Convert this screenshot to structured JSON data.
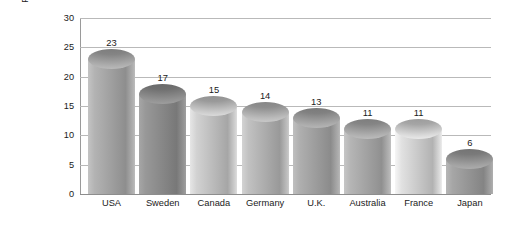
{
  "chart_data": {
    "type": "bar",
    "title": "",
    "subtitle": "",
    "xlabel": "",
    "ylabel": "Percentage of single-parent families\nwith children under 18",
    "categories": [
      "USA",
      "Sweden",
      "Canada",
      "Germany",
      "U.K.",
      "Australia",
      "France",
      "Japan"
    ],
    "values": [
      23,
      17,
      15,
      14,
      13,
      11,
      11,
      6
    ],
    "value_labels": [
      "23",
      "17",
      "15",
      "14",
      "13",
      "11",
      "11",
      "6"
    ],
    "ylim": [
      0,
      30
    ],
    "yticks": [
      0,
      5,
      10,
      15,
      20,
      25,
      30
    ],
    "ytick_labels": [
      "0",
      "5",
      "10",
      "15",
      "20",
      "25",
      "30"
    ],
    "grid": true,
    "grid_axis": "y",
    "legend": false,
    "legend_position": "none",
    "bar_style": "cylinder",
    "bar_colors": [
      "#a9a9a9",
      "#8f8f8f",
      "#c6c6c6",
      "#b6b6b6",
      "#a5a5a5",
      "#ababab",
      "#d4d4d4",
      "#9d9d9d"
    ],
    "axis_color": "#9a9a9a",
    "gridline_color": "#b9b9b9",
    "background_color": "#ffffff",
    "text_color": "#1a1a1a"
  }
}
